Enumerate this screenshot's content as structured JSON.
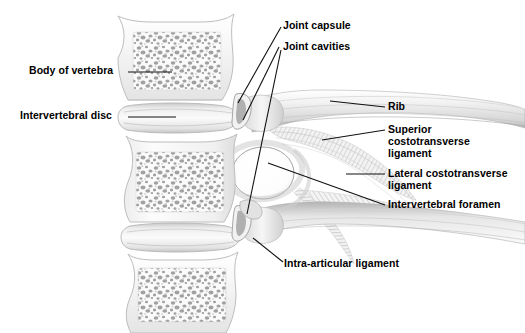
{
  "figure": {
    "background_color": "#ffffff",
    "label_color": "#000000",
    "leader_line_color": "#1a1a1a",
    "width": 525,
    "height": 333
  },
  "labels": {
    "body_of_vertebra": "Body of vertebra",
    "intervertebral_disc": "Intervertebral disc",
    "joint_capsule": "Joint capsule",
    "joint_cavities": "Joint cavities",
    "rib": "Rib",
    "superior_costotransverse_ligament_l1": "Superior",
    "superior_costotransverse_ligament_l2": "costotransverse",
    "superior_costotransverse_ligament_l3": "ligament",
    "lateral_costotransverse_ligament_l1": "Lateral costotransverse",
    "lateral_costotransverse_ligament_l2": "ligament",
    "intervertebral_foramen": "Intervertebral foramen",
    "intra_articular_ligament": "Intra-articular ligament"
  },
  "structures": {
    "vertebra_count": 3,
    "disc_count": 2,
    "bone_fill": "#f4f4f4",
    "bone_outline": "#b9b9b9",
    "trabecular_tone": "#9a9a9a",
    "cartilage_tone": "#dcdcdc",
    "ligament_tone": "#cfcfcf",
    "foramen_fill": "#ffffff"
  }
}
